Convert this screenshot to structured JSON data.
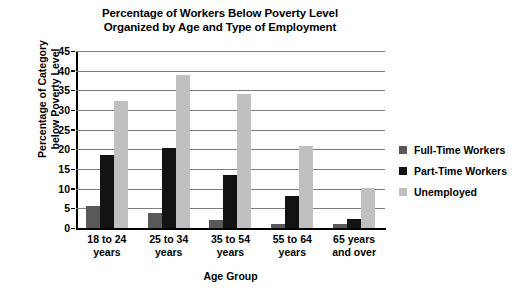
{
  "chart_data": {
    "type": "bar",
    "title": "Percentage of Workers Below Poverty Level Organized by Age and Type of Employment",
    "title_line1": "Percentage of Workers Below Poverty Level",
    "title_line2": "Organized by Age and Type of Employment",
    "xlabel": "Age Group",
    "ylabel": "Percentage of Category below Poverty Level",
    "ylabel_line1": "Percentage of Category",
    "ylabel_line2": "below Poverty Level",
    "categories": [
      "18 to 24 years",
      "25 to 34 years",
      "35 to 54 years",
      "55 to 64 years",
      "65 years and over"
    ],
    "category_lines": [
      [
        "18 to 24",
        "years"
      ],
      [
        "25 to 34",
        "years"
      ],
      [
        "35 to 54",
        "years"
      ],
      [
        "55 to 64",
        "years"
      ],
      [
        "65 years",
        "and over"
      ]
    ],
    "series": [
      {
        "name": "Full-Time Workers",
        "color": "#595959",
        "values": [
          5.6,
          3.8,
          2.1,
          1.1,
          1.0
        ]
      },
      {
        "name": "Part-Time Workers",
        "color": "#131313",
        "values": [
          18.5,
          20.3,
          13.4,
          8.1,
          2.4
        ]
      },
      {
        "name": "Unemployed",
        "color": "#c0c0c0",
        "values": [
          32.4,
          39.0,
          34.0,
          20.9,
          10.3
        ]
      }
    ],
    "ylim": [
      0,
      45
    ],
    "ytick_values": [
      0,
      5,
      10,
      15,
      20,
      25,
      30,
      35,
      40,
      45
    ],
    "grid": true,
    "legend_position": "right"
  }
}
